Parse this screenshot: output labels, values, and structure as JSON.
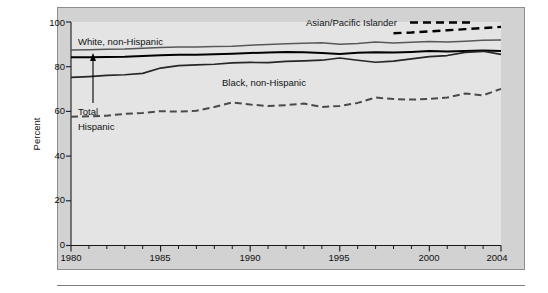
{
  "chart_data": {
    "type": "line",
    "title": "",
    "subtitle": "",
    "xlabel": "",
    "ylabel": "Percent",
    "xlim": [
      1980,
      2004
    ],
    "ylim": [
      0,
      100
    ],
    "grid": false,
    "legend_position": "inline-annotations",
    "y_ticks": [
      "0",
      "20",
      "40",
      "60",
      "80",
      "100"
    ],
    "y_tick_values": [
      0,
      20,
      40,
      60,
      80,
      100
    ],
    "x_ticks": [
      "1980",
      "1985",
      "1990",
      "1995",
      "2000",
      "2004"
    ],
    "x_tick_values": [
      1980,
      1985,
      1990,
      1995,
      2000,
      2004
    ],
    "x_minor_tick_interval": 1,
    "x": [
      1980,
      1981,
      1982,
      1983,
      1984,
      1985,
      1986,
      1987,
      1988,
      1989,
      1990,
      1991,
      1992,
      1993,
      1994,
      1995,
      1996,
      1997,
      1998,
      1999,
      2000,
      2001,
      2002,
      2003,
      2004
    ],
    "series": [
      {
        "name": "Asian/Pacific Islander",
        "style": "dashed-bold",
        "color": "#000000",
        "label_text": "Asian/Pacific Islander",
        "values": [
          null,
          null,
          null,
          null,
          null,
          null,
          null,
          null,
          null,
          null,
          null,
          null,
          null,
          null,
          null,
          null,
          null,
          null,
          95.0,
          95.3,
          95.8,
          96.3,
          96.8,
          97.3,
          97.8
        ]
      },
      {
        "name": "White, non-Hispanic",
        "style": "solid-gray",
        "color": "#585858",
        "label_text": "White, non-Hispanic",
        "values": [
          87.5,
          87.6,
          87.8,
          87.9,
          88.2,
          88.6,
          88.8,
          88.8,
          89.0,
          89.2,
          89.6,
          89.9,
          90.3,
          90.5,
          90.7,
          90.1,
          90.4,
          91.0,
          90.6,
          90.9,
          91.3,
          91.0,
          91.4,
          91.8,
          92.0
        ]
      },
      {
        "name": "Total",
        "style": "solid-black",
        "color": "#000000",
        "label_text": "Total",
        "values": [
          84.2,
          84.2,
          84.3,
          84.4,
          84.8,
          85.1,
          85.3,
          85.4,
          85.6,
          85.8,
          86.1,
          86.4,
          86.6,
          86.5,
          86.1,
          85.7,
          86.2,
          86.5,
          86.3,
          86.6,
          87.0,
          86.8,
          87.0,
          87.2,
          87.0
        ]
      },
      {
        "name": "Black, non-Hispanic",
        "style": "solid-dark",
        "color": "#262626",
        "label_text": "Black, non-Hispanic",
        "values": [
          75.2,
          75.6,
          76.1,
          76.4,
          77.0,
          79.4,
          80.5,
          80.8,
          81.1,
          81.7,
          81.9,
          81.8,
          82.4,
          82.6,
          82.9,
          83.9,
          82.9,
          82.0,
          82.5,
          83.5,
          84.5,
          85.0,
          86.4,
          86.9,
          85.5
        ]
      },
      {
        "name": "Hispanic",
        "style": "dashed-gray",
        "color": "#4a4a4a",
        "label_text": "Hispanic",
        "values": [
          57.6,
          57.8,
          58.1,
          58.9,
          59.3,
          60.1,
          59.9,
          60.3,
          62.0,
          64.0,
          63.1,
          62.4,
          62.8,
          63.5,
          62.0,
          62.4,
          63.8,
          66.2,
          65.5,
          65.3,
          65.6,
          66.2,
          68.0,
          67.2,
          70.1
        ]
      }
    ],
    "annotations": [
      {
        "text": "White, non-Hispanic",
        "target": "White, non-Hispanic"
      },
      {
        "text": "Black, non-Hispanic",
        "target": "Black, non-Hispanic"
      },
      {
        "text": "Asian/Pacific Islander",
        "target": "Asian/Pacific Islander"
      },
      {
        "text": "Hispanic",
        "target": "Hispanic"
      },
      {
        "text": "Total",
        "target": "Total",
        "has_arrow": true
      }
    ]
  },
  "figure": {
    "panel_background": "#d2d2d2",
    "plot_background": "#e4e4e4",
    "border_color": "#8d8d8d"
  },
  "labels": {
    "y_axis_title": "Percent",
    "y_100": "100",
    "y_80": "80",
    "y_60": "60",
    "y_40": "40",
    "y_20": "20",
    "y_0": "0",
    "x_1980": "1980",
    "x_1985": "1985",
    "x_1990": "1990",
    "x_1995": "1995",
    "x_2000": "2000",
    "x_2004": "2004",
    "series_white": "White, non-Hispanic",
    "series_black": "Black, non-Hispanic",
    "series_asian": "Asian/Pacific Islander",
    "series_hispanic": "Hispanic",
    "series_total": "Total"
  }
}
